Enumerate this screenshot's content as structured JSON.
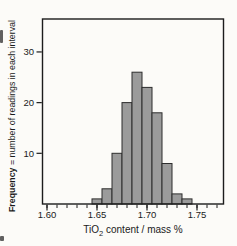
{
  "figure": {
    "background": "#fcfbf8"
  },
  "chart_data": {
    "type": "bar",
    "subtype": "histogram",
    "title": "",
    "xlabel_prefix": "TiO",
    "xlabel_sub": "2",
    "xlabel_suffix": " content / mass %",
    "ylabel_bold": "Frequency",
    "ylabel_rest": " = number of readings in each interval",
    "bin_width": 0.01,
    "bin_centers": [
      1.65,
      1.66,
      1.67,
      1.68,
      1.69,
      1.7,
      1.71,
      1.72,
      1.73,
      1.74
    ],
    "frequencies": [
      1,
      3,
      10,
      20,
      26,
      23,
      18,
      8,
      2,
      1
    ],
    "x_tick_values": [
      1.6,
      1.65,
      1.7,
      1.75
    ],
    "x_tick_labels": [
      "1.60",
      "1.65",
      "1.70",
      "1.75"
    ],
    "x_minor_tick_start": 1.6,
    "x_minor_tick_step": 0.01,
    "x_minor_tick_end": 1.77,
    "y_tick_values": [
      10,
      20,
      30
    ],
    "y_tick_labels": [
      "10",
      "20",
      "30"
    ],
    "xlim": [
      1.5955,
      1.7765
    ],
    "ylim": [
      0,
      36.5
    ],
    "grid": false,
    "legend": null,
    "colors": {
      "bar_fill": "#9b9b9b",
      "bar_edge": "#2d2d2d",
      "axis": "#1c1c1c",
      "text": "#1a1a1a"
    }
  }
}
